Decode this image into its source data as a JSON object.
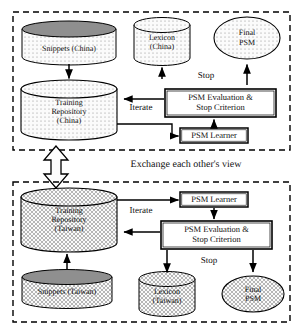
{
  "figure": {
    "type": "flow-diagram",
    "panels": [
      {
        "id": "china",
        "region_label": "(China)",
        "nodes": [
          {
            "name": "snippets-china",
            "shape": "cylinder",
            "label": "Snippets (China)",
            "lines": [
              "Snippets (China)"
            ],
            "fill": "dot-pattern",
            "top_fill": "dark-gray"
          },
          {
            "name": "lexicon-china",
            "shape": "cylinder",
            "label": "Lexicon (China)",
            "lines": [
              "Lexicon",
              "(China)"
            ],
            "fill": "dot-pattern",
            "top_fill": "light"
          },
          {
            "name": "final-psm-china",
            "shape": "ellipse",
            "label": "Final PSM",
            "lines": [
              "Final",
              "PSM"
            ],
            "fill": "dot-pattern"
          },
          {
            "name": "training-repository-china",
            "shape": "cylinder",
            "label": "Training Repository (China)",
            "lines": [
              "Training",
              "Repository",
              "(China)"
            ],
            "fill": "dot-pattern",
            "top_fill": "light"
          },
          {
            "name": "psm-evaluation-china",
            "shape": "box",
            "label": "PSM Evaluation & Stop Criterion",
            "lines": [
              "PSM Evaluation &",
              "Stop Criterion"
            ],
            "border": "double"
          },
          {
            "name": "psm-learner-china",
            "shape": "box",
            "label": "PSM Learner",
            "lines": [
              "PSM Learner"
            ],
            "border": "double"
          }
        ],
        "edge_labels": [
          {
            "name": "edge-label-stop-china",
            "text": "Stop"
          },
          {
            "name": "edge-label-iterate-china",
            "text": "Iterate"
          }
        ]
      },
      {
        "id": "taiwan",
        "region_label": "(Taiwan)",
        "nodes": [
          {
            "name": "psm-learner-taiwan",
            "shape": "box",
            "label": "PSM Learner",
            "lines": [
              "PSM Learner"
            ],
            "border": "double"
          },
          {
            "name": "psm-evaluation-taiwan",
            "shape": "box",
            "label": "PSM Evaluation & Stop Criterion",
            "lines": [
              "PSM Evaluation &",
              "Stop Criterion"
            ],
            "border": "double"
          },
          {
            "name": "training-repository-taiwan",
            "shape": "cylinder",
            "label": "Training Repository (Taiwan)",
            "lines": [
              "Training",
              "Repository",
              "(Taiwan)"
            ],
            "fill": "hatch-pattern",
            "top_fill": "light"
          },
          {
            "name": "snippets-taiwan",
            "shape": "cylinder",
            "label": "Snippets (Taiwan)",
            "lines": [
              "Snippets (Taiwan)"
            ],
            "fill": "hatch-pattern",
            "top_fill": "dark-gray"
          },
          {
            "name": "lexicon-taiwan",
            "shape": "cylinder",
            "label": "Lexicon (Taiwan)",
            "lines": [
              "Lexicon",
              "(Taiwan)"
            ],
            "fill": "hatch-pattern",
            "top_fill": "light"
          },
          {
            "name": "final-psm-taiwan",
            "shape": "ellipse",
            "label": "Final PSM",
            "lines": [
              "Final",
              "PSM"
            ],
            "fill": "hatch-pattern"
          }
        ],
        "edge_labels": [
          {
            "name": "edge-label-stop-taiwan",
            "text": "Stop"
          },
          {
            "name": "edge-label-iterate-taiwan",
            "text": "Iterate"
          }
        ]
      }
    ],
    "exchange_label": "Exchange each other's view",
    "colors": {
      "stroke": "#000000",
      "background": "#ffffff",
      "pattern_fill": "#f2f2f2",
      "dark_top": "#8f8f8f",
      "text": "#111111"
    }
  },
  "labels": {
    "snippets_china": "Snippets (China)",
    "lexicon_china_l1": "Lexicon",
    "lexicon_china_l2": "(China)",
    "final_psm_china_l1": "Final",
    "final_psm_china_l2": "PSM",
    "training_china_l1": "Training",
    "training_china_l2": "Repository",
    "training_china_l3": "(China)",
    "psm_eval_china_l1": "PSM Evaluation &",
    "psm_eval_china_l2": "Stop Criterion",
    "psm_learner_china": "PSM Learner",
    "stop_china": "Stop",
    "iterate_china": "Iterate",
    "exchange": "Exchange each other's view",
    "psm_learner_taiwan": "PSM Learner",
    "psm_eval_taiwan_l1": "PSM Evaluation &",
    "psm_eval_taiwan_l2": "Stop Criterion",
    "training_taiwan_l1": "Training",
    "training_taiwan_l2": "Repository",
    "training_taiwan_l3": "(Taiwan)",
    "iterate_taiwan": "Iterate",
    "stop_taiwan": "Stop",
    "snippets_taiwan": "Snippets (Taiwan)",
    "lexicon_taiwan_l1": "Lexicon",
    "lexicon_taiwan_l2": "(Taiwan)",
    "final_psm_taiwan_l1": "Final",
    "final_psm_taiwan_l2": "PSM"
  }
}
